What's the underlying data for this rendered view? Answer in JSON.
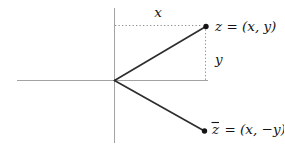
{
  "diagram": {
    "labels": {
      "x_distance": "x",
      "y_distance": "y",
      "z_point": "z = (x, y)",
      "z_conjugate_symbol": "z",
      "z_conjugate_value": "= (x, −y)"
    },
    "colors": {
      "axis": "#a3a3a3",
      "segment": "#2e2e2e",
      "dotted_guide": "#8f8f8f",
      "point": "#141414",
      "label_text": "#141414"
    }
  }
}
